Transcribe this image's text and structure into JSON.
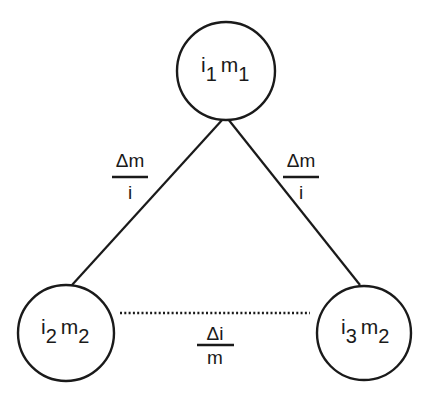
{
  "diagram": {
    "type": "triangle-relationship",
    "colors": {
      "stroke": "#1a1a1a",
      "background": "#ffffff"
    },
    "nodes": [
      {
        "id": "top",
        "var1": "i",
        "sub1": "1",
        "var2": "m",
        "sub2": "1",
        "cx": 226,
        "cy": 71,
        "r": 49
      },
      {
        "id": "bottom-left",
        "var1": "i",
        "sub1": "2",
        "var2": "m",
        "sub2": "2",
        "cx": 66,
        "cy": 333,
        "r": 48
      },
      {
        "id": "bottom-right",
        "var1": "i",
        "sub1": "3",
        "var2": "m",
        "sub2": "2",
        "cx": 364,
        "cy": 333,
        "r": 47
      }
    ],
    "edges": [
      {
        "from": "top",
        "to": "bottom-left",
        "style": "solid",
        "label_num": "Δm",
        "label_den": "i"
      },
      {
        "from": "top",
        "to": "bottom-right",
        "style": "solid",
        "label_num": "Δm",
        "label_den": "i"
      },
      {
        "from": "bottom-left",
        "to": "bottom-right",
        "style": "dotted",
        "label_num": "Δi",
        "label_den": "m"
      }
    ]
  }
}
